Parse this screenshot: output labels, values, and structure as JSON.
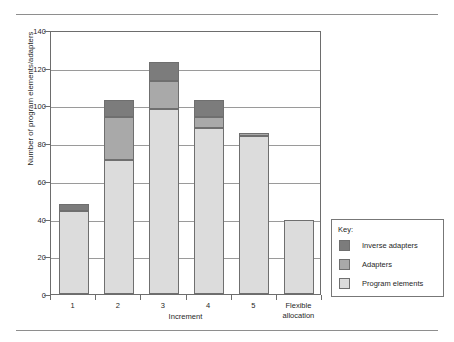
{
  "chart_data": {
    "type": "bar",
    "subtype": "stacked",
    "title": "",
    "xlabel": "Increment",
    "ylabel": "Number of program elements/adapters",
    "categories": [
      "1",
      "2",
      "3",
      "4",
      "5",
      "Flexible allocation"
    ],
    "category_lines": [
      [
        "1"
      ],
      [
        "2"
      ],
      [
        "3"
      ],
      [
        "4"
      ],
      [
        "5"
      ],
      [
        "Flexible",
        "allocation"
      ]
    ],
    "series": [
      {
        "name": "Program elements",
        "color": "#dcdcdc",
        "values": [
          44,
          71,
          98,
          88,
          84,
          39
        ]
      },
      {
        "name": "Adapters",
        "color": "#a9a9a9",
        "values": [
          0,
          23,
          15,
          6,
          1.5,
          0
        ]
      },
      {
        "name": "Inverse adapters",
        "color": "#7c7c7c",
        "values": [
          4,
          9,
          10,
          9,
          0,
          0
        ]
      }
    ],
    "totals": [
      48,
      103,
      123,
      103,
      85.5,
      39
    ],
    "ylim": [
      0,
      140
    ],
    "yticks": [
      0,
      20,
      40,
      60,
      80,
      100,
      120,
      140
    ],
    "ytick_labels": [
      "0",
      "20",
      "40",
      "60",
      "80",
      "100",
      "120",
      "140"
    ],
    "grid": "horizontal",
    "legend_position": "right-outside"
  },
  "legend": {
    "title": "Key:",
    "entries": [
      {
        "label": "Inverse adapters",
        "color": "#7c7c7c"
      },
      {
        "label": "Adapters",
        "color": "#a9a9a9"
      },
      {
        "label": "Program elements",
        "color": "#dcdcdc"
      }
    ]
  },
  "colors": {
    "axis": "#6d6d6d",
    "grid": "#9a9a9a",
    "rule": "#8e8e8e",
    "background": "#ffffff",
    "text": "#1f1f1f"
  }
}
